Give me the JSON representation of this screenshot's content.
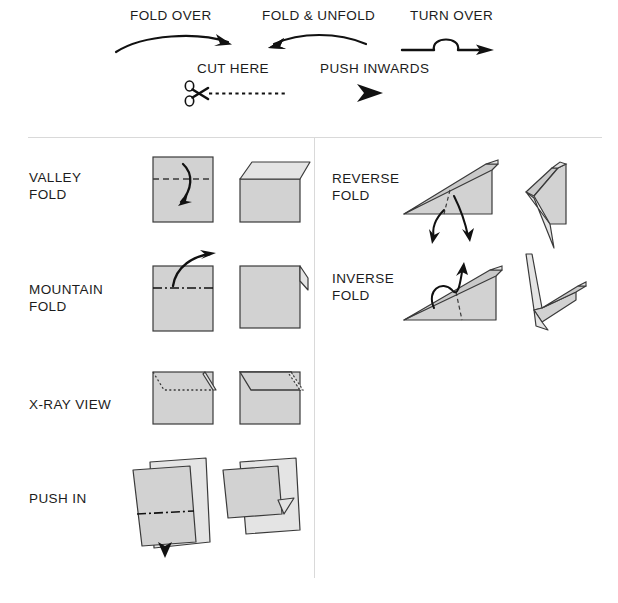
{
  "document": {
    "title": "Origami Symbols Key",
    "paper_fill": "#d2d2d2",
    "paper_fill_light": "#e4e4e4",
    "paper_fill_mid": "#c9c9c9",
    "stroke": "#3a3a3a",
    "ink": "#1c1c1c",
    "rule_color": "#d9d9d9",
    "background": "#ffffff"
  },
  "legend": {
    "items": [
      {
        "id": "fold-over",
        "label": "FOLD OVER",
        "symbol": "curved-arrow-right"
      },
      {
        "id": "fold-unfold",
        "label": "FOLD & UNFOLD",
        "symbol": "curved-double-arrow"
      },
      {
        "id": "turn-over",
        "label": "TURN OVER",
        "symbol": "loop-arrow"
      },
      {
        "id": "cut-here",
        "label": "CUT HERE",
        "symbol": "scissors-dashed-line"
      },
      {
        "id": "push-inwards",
        "label": "PUSH INWARDS",
        "symbol": "solid-arrowhead"
      }
    ]
  },
  "left_column": {
    "rows": [
      {
        "id": "valley-fold",
        "label": "VALLEY\nFOLD",
        "crease": "dashed",
        "note": "square with dashed crease, flap folds forward"
      },
      {
        "id": "mountain-fold",
        "label": "MOUNTAIN\nFOLD",
        "crease": "dash-dot",
        "note": "square with dash-dot crease, flap folds behind"
      },
      {
        "id": "x-ray-view",
        "label": "X-RAY VIEW",
        "crease": "dotted",
        "note": "hidden edge shown as dotted line"
      },
      {
        "id": "push-in",
        "label": "PUSH IN",
        "crease": "dash-dot",
        "note": "arrow pushes edge inward"
      }
    ]
  },
  "right_column": {
    "rows": [
      {
        "id": "reverse-fold",
        "label": "REVERSE\nFOLD",
        "crease": "dashed",
        "note": "wedge with double curved arrows"
      },
      {
        "id": "inverse-fold",
        "label": "INVERSE\nFOLD",
        "crease": "dashed",
        "note": "wedge with arrow curving over spine"
      }
    ]
  }
}
